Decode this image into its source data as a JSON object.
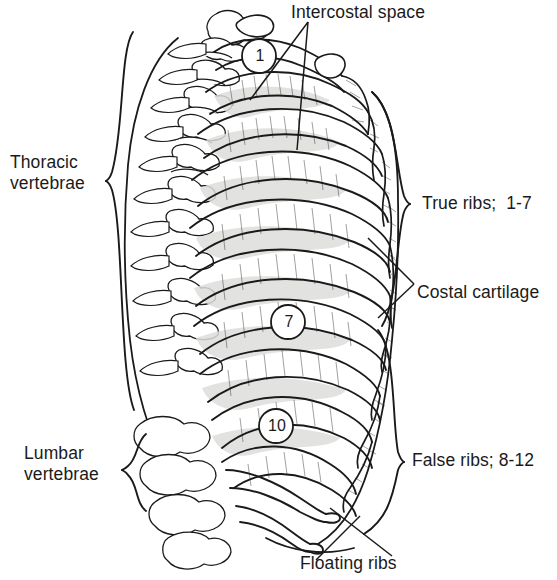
{
  "figure": {
    "background_color": "#ffffff",
    "ink_color": "#1a1a1a",
    "shade_color": "#d8d8d6"
  },
  "labels": {
    "intercostal_space": "Intercostal space",
    "thoracic_vertebrae_line1": "Thoracic",
    "thoracic_vertebrae_line2": "vertebrae",
    "lumbar_vertebrae_line1": "Lumbar",
    "lumbar_vertebrae_line2": "vertebrae",
    "true_ribs": "True ribs;  1-7",
    "costal_cartilage": "Costal cartilage",
    "false_ribs": "False ribs; 8-12",
    "floating_ribs": "Floating ribs"
  },
  "markers": {
    "rib_1": "1",
    "rib_7": "7",
    "rib_10": "10"
  }
}
